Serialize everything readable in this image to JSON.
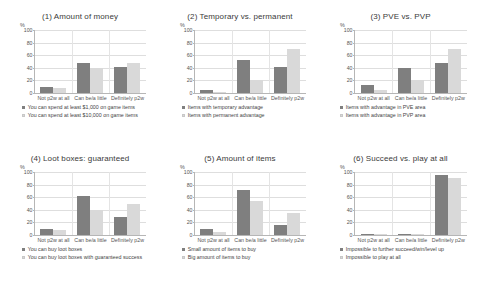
{
  "figure": {
    "categories": [
      "Not p2w at all",
      "Can be/a little",
      "Definitely p2w"
    ],
    "y_axis_unit": "%",
    "y_ticks": [
      "0",
      "20",
      "40",
      "60",
      "80",
      "100"
    ],
    "colors": {
      "series_a": "#7f7f7f",
      "series_b": "#d9d9d9"
    }
  },
  "chart_data": [
    {
      "type": "bar",
      "title": "(1) Amount of money",
      "categories": [
        "Not p2w at all",
        "Can be/a little",
        "Definitely p2w"
      ],
      "series": [
        {
          "name": "You can spend at least $1,000 on game items",
          "values": [
            10,
            47,
            42
          ]
        },
        {
          "name": "You can spend at least $10,000 on game items",
          "values": [
            8,
            40,
            48
          ]
        }
      ],
      "xlabel": "",
      "ylabel": "%",
      "ylim": [
        0,
        100
      ],
      "grid": true,
      "legend": "bottom"
    },
    {
      "type": "bar",
      "title": "(2) Temporary vs. permanent",
      "categories": [
        "Not p2w at all",
        "Can be/a little",
        "Definitely p2w"
      ],
      "series": [
        {
          "name": "Items with temporary advantage",
          "values": [
            4,
            52,
            42
          ]
        },
        {
          "name": "Items with permanent advantage",
          "values": [
            2,
            21,
            70
          ]
        }
      ],
      "xlabel": "",
      "ylabel": "%",
      "ylim": [
        0,
        100
      ],
      "grid": true,
      "legend": "bottom"
    },
    {
      "type": "bar",
      "title": "(3) PVE vs. PVP",
      "categories": [
        "Not p2w at all",
        "Can be/a little",
        "Definitely p2w"
      ],
      "series": [
        {
          "name": "Items with advantage in PVE area",
          "values": [
            12,
            40,
            47
          ]
        },
        {
          "name": "Items with advantage in PVP area",
          "values": [
            5,
            21,
            70
          ]
        }
      ],
      "xlabel": "",
      "ylabel": "%",
      "ylim": [
        0,
        100
      ],
      "grid": true,
      "legend": "bottom"
    },
    {
      "type": "bar",
      "title": "(4) Loot boxes: guaranteed",
      "categories": [
        "Not p2w at all",
        "Can be/a little",
        "Definitely p2w"
      ],
      "series": [
        {
          "name": "You can buy loot boxes",
          "values": [
            10,
            62,
            29
          ]
        },
        {
          "name": "You can buy loot boxes with guaranteed success",
          "values": [
            8,
            39,
            50
          ]
        }
      ],
      "xlabel": "",
      "ylabel": "%",
      "ylim": [
        0,
        100
      ],
      "grid": true,
      "legend": "bottom"
    },
    {
      "type": "bar",
      "title": "(5) Amount of items",
      "categories": [
        "Not p2w at all",
        "Can be/a little",
        "Definitely p2w"
      ],
      "series": [
        {
          "name": "Small amount of items to buy",
          "values": [
            10,
            72,
            16
          ]
        },
        {
          "name": "Big amount of items to buy",
          "values": [
            5,
            54,
            35
          ]
        }
      ],
      "xlabel": "",
      "ylabel": "%",
      "ylim": [
        0,
        100
      ],
      "grid": true,
      "legend": "bottom"
    },
    {
      "type": "bar",
      "title": "(6) Succeed vs. play at all",
      "categories": [
        "Not p2w at all",
        "Can be/a little",
        "Definitely p2w"
      ],
      "series": [
        {
          "name": "Impossible to further succeed/win/level up",
          "values": [
            2,
            1,
            95
          ]
        },
        {
          "name": "Impossible to play at all",
          "values": [
            1,
            1,
            90
          ]
        }
      ],
      "xlabel": "",
      "ylabel": "%",
      "ylim": [
        0,
        100
      ],
      "grid": true,
      "legend": "bottom"
    }
  ]
}
